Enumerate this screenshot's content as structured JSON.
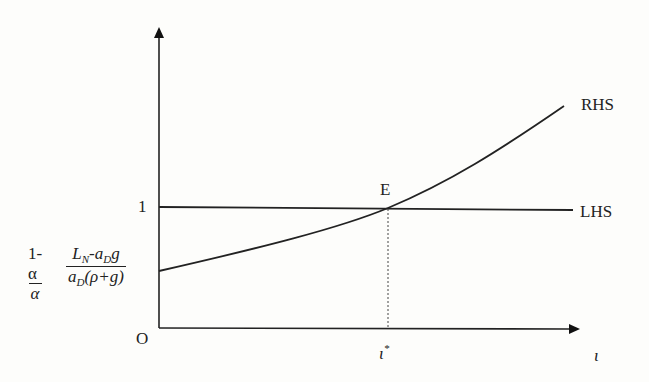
{
  "diagram": {
    "type": "line",
    "axes": {
      "origin_label": "O",
      "x_label": "ι",
      "y_tick_label": "1"
    },
    "curves": [
      {
        "name": "LHS",
        "label": "LHS",
        "description": "horizontal line at value 1"
      },
      {
        "name": "RHS",
        "label": "RHS",
        "description": "increasing convex curve starting at intercept"
      }
    ],
    "equilibrium": {
      "label": "E",
      "x_label": "ι",
      "x_label_sup": "*"
    },
    "intercept_label": {
      "frac1_num": "1-α",
      "frac1_den": "α",
      "frac2_num_a": "L",
      "frac2_num_a_sub": "N",
      "frac2_num_b": "-a",
      "frac2_num_b_sub": "D",
      "frac2_num_c": "g",
      "frac2_den_a": "a",
      "frac2_den_a_sub": "D",
      "frac2_den_b": "(ρ+g)"
    },
    "colors": {
      "line": "#222222",
      "background": "#fdfdfb"
    }
  }
}
